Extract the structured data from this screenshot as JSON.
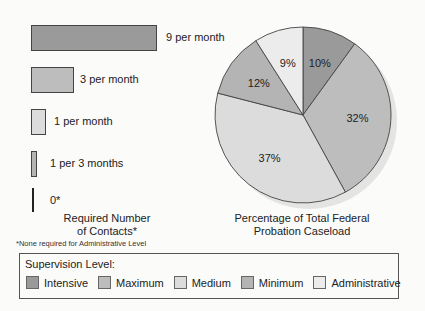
{
  "colors": {
    "intensive": "#9a9a9a",
    "maximum": "#bdbdbd",
    "medium": "#dcdcdc",
    "minimum": "#b4b4b4",
    "administrative": "#ececec",
    "outline": "#444444"
  },
  "contacts": {
    "bars": [
      {
        "level": "Intensive",
        "label": "9 per month"
      },
      {
        "level": "Maximum",
        "label": "3 per month"
      },
      {
        "level": "Medium",
        "label": "1 per month"
      },
      {
        "level": "Minimum",
        "label": "1 per 3 months"
      },
      {
        "level": "Administrative",
        "label": "0*"
      }
    ],
    "caption_line1": "Required Number",
    "caption_line2": "of Contacts*",
    "footnote": "*None required for Administrative Level"
  },
  "pie": {
    "caption_line1": "Percentage of Total Federal",
    "caption_line2": "Probation Caseload",
    "slices": [
      {
        "level": "Intensive",
        "label": "10%"
      },
      {
        "level": "Maximum",
        "label": "32%"
      },
      {
        "level": "Medium",
        "label": "37%"
      },
      {
        "level": "Minimum",
        "label": "12%"
      },
      {
        "level": "Administrative",
        "label": "9%"
      }
    ]
  },
  "legend": {
    "title": "Supervision Level:",
    "items": [
      "Intensive",
      "Maximum",
      "Medium",
      "Minimum",
      "Administrative"
    ]
  },
  "chart_data": [
    {
      "type": "bar",
      "orientation": "horizontal",
      "title": "Required Number of Contacts*",
      "categories": [
        "Intensive",
        "Maximum",
        "Medium",
        "Minimum",
        "Administrative"
      ],
      "values": [
        9,
        3,
        1,
        0.333,
        0
      ],
      "value_labels": [
        "9 per month",
        "3 per month",
        "1 per month",
        "1 per 3 months",
        "0*"
      ],
      "unit": "contacts per month",
      "footnote": "*None required for Administrative Level",
      "grid": false
    },
    {
      "type": "pie",
      "title": "Percentage of Total Federal Probation Caseload",
      "categories": [
        "Intensive",
        "Maximum",
        "Medium",
        "Minimum",
        "Administrative"
      ],
      "values": [
        10,
        32,
        37,
        12,
        9
      ],
      "start_angle": "12 o'clock",
      "direction": "clockwise",
      "legend_title": "Supervision Level:",
      "legend_position": "bottom"
    }
  ]
}
